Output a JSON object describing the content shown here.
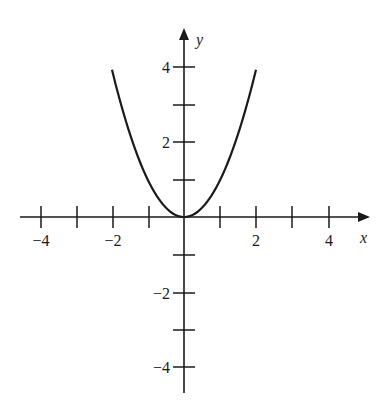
{
  "chart_data": {
    "type": "line",
    "title": "",
    "xlabel": "x",
    "ylabel": "y",
    "xlim": [
      -4.5,
      5
    ],
    "ylim": [
      -4.7,
      5
    ],
    "grid": false,
    "x_ticks": [
      -4,
      -3,
      -2,
      -1,
      1,
      2,
      3,
      4
    ],
    "x_tick_labels": [
      "-4",
      "-2",
      "2",
      "4"
    ],
    "y_ticks": [
      -4,
      -3,
      -2,
      -1,
      1,
      2,
      3,
      4
    ],
    "y_tick_labels": [
      "4",
      "2",
      "-2",
      "-4"
    ],
    "series": [
      {
        "name": "y = x^2",
        "function": "x^2",
        "domain": [
          -2,
          2
        ],
        "x": [
          -2,
          -1.5,
          -1,
          -0.5,
          0,
          0.5,
          1,
          1.5,
          2
        ],
        "y": [
          4,
          2.25,
          1,
          0.25,
          0,
          0.25,
          1,
          2.25,
          4
        ]
      }
    ]
  },
  "labels": {
    "x_axis": "x",
    "y_axis": "y",
    "xt_m4": "−4",
    "xt_m2": "−2",
    "xt_2": "2",
    "xt_4": "4",
    "yt_4": "4",
    "yt_2": "2",
    "yt_m2": "−2",
    "yt_m4": "−4"
  }
}
